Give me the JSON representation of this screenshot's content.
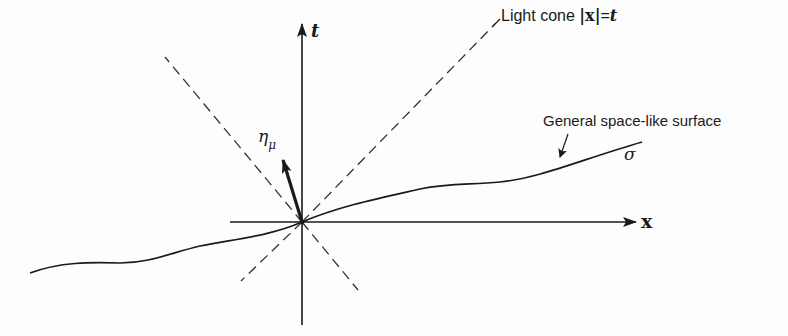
{
  "figure": {
    "colors": {
      "ink": "#1a1a1a",
      "background": "#fdfdfd"
    },
    "axes": {
      "t_label": "t",
      "x_label": "x"
    },
    "labels": {
      "light_cone_prefix": "Light cone ",
      "light_cone_abs": "|x|",
      "light_cone_eq": "=",
      "light_cone_t": "t",
      "surface": "General space-like surface",
      "sigma": "σ",
      "normal_eta": "η",
      "normal_mu": "μ"
    }
  }
}
